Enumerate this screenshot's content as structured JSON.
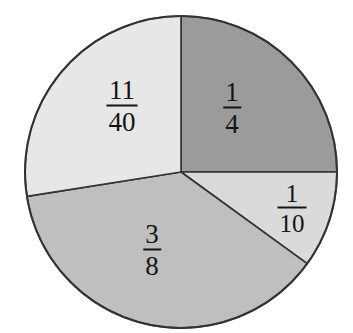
{
  "chart_data": {
    "type": "pie",
    "title": "",
    "subtitle": "",
    "xlabel": "",
    "ylabel": "",
    "legend": "none",
    "grid": false,
    "start_angle_deg": 0,
    "direction": "clockwise",
    "center": {
      "x": 181,
      "y": 172
    },
    "radius": 156,
    "labels_inside": true,
    "background_color": "#ffffff",
    "border_color": "#333333",
    "categories": [
      "1/4",
      "1/10",
      "3/8",
      "11/40"
    ],
    "values": [
      0.25,
      0.1,
      0.375,
      0.275
    ],
    "slices": [
      {
        "name": "quarter",
        "label_numerator": "1",
        "label_denominator": "4",
        "value": 0.25,
        "percent": 25,
        "start_angle_deg": 0,
        "end_angle_deg": 90,
        "sweep_deg": 90,
        "color": "#9b9b9b",
        "label_x": 232,
        "label_y": 108
      },
      {
        "name": "tenth",
        "label_numerator": "1",
        "label_denominator": "10",
        "value": 0.1,
        "percent": 10,
        "start_angle_deg": 90,
        "end_angle_deg": 126,
        "sweep_deg": 36,
        "color": "#dadada",
        "label_x": 292,
        "label_y": 208
      },
      {
        "name": "three-eighths",
        "label_numerator": "3",
        "label_denominator": "8",
        "value": 0.375,
        "percent": 37.5,
        "start_angle_deg": 126,
        "end_angle_deg": 261,
        "sweep_deg": 135,
        "color": "#bfbfbf",
        "label_x": 152,
        "label_y": 250
      },
      {
        "name": "eleven-fortieths",
        "label_numerator": "11",
        "label_denominator": "40",
        "value": 0.275,
        "percent": 27.5,
        "start_angle_deg": 261,
        "end_angle_deg": 360,
        "sweep_deg": 99,
        "color": "#e7e7e7",
        "label_x": 122,
        "label_y": 106
      }
    ]
  }
}
